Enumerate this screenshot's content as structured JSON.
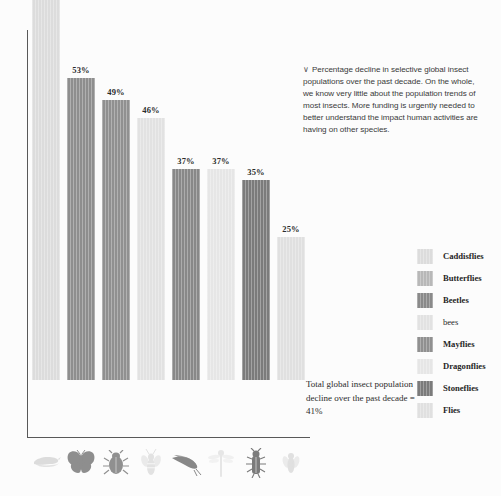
{
  "chart_data": {
    "type": "bar",
    "title": "",
    "subtitle": "",
    "xlabel": "",
    "ylabel": "",
    "ylim": [
      0,
      75
    ],
    "grid": false,
    "legend_position": "right",
    "categories": [
      "Caddisflies",
      "Butterflies",
      "Beetles",
      "bees",
      "Mayflies",
      "Dragonflies",
      "Stoneflies",
      "Flies"
    ],
    "values": [
      68,
      53,
      49,
      46,
      37,
      37,
      35,
      25
    ],
    "value_labels": [
      "68%",
      "53%",
      "49%",
      "46%",
      "37%",
      "37%",
      "35%",
      "25%"
    ],
    "colors": [
      "#dcdcdc",
      "#8e8e8e",
      "#909090",
      "#e2e2e2",
      "#888888",
      "#e6e6e6",
      "#7b7b7b",
      "#e0e0e0"
    ],
    "icons": [
      "caddisfly-icon",
      "butterfly-icon",
      "beetle-icon",
      "bee-icon",
      "mayfly-icon",
      "dragonfly-icon",
      "stonefly-icon",
      "fly-icon"
    ]
  },
  "description": {
    "chevron": "∨",
    "text": "Percentage decline in selective global insect populations over the past decade. On the whole, we know very little about the population trends of most insects. More funding is urgently needed to better understand the impact human activities are having on other species."
  },
  "total_note": {
    "text": "Total global insect population decline over the past decade = 41%"
  },
  "legend": {
    "items": [
      {
        "label": "Caddisflies",
        "color": "#dcdcdc"
      },
      {
        "label": "Butterflies",
        "color": "#b8b8b8"
      },
      {
        "label": "Beetles",
        "color": "#8a8a8a"
      },
      {
        "label": "bees",
        "color": "#e2e2e2"
      },
      {
        "label": "Mayflies",
        "color": "#909090"
      },
      {
        "label": "Dragonflies",
        "color": "#e6e6e6"
      },
      {
        "label": "Stoneflies",
        "color": "#7b7b7b"
      },
      {
        "label": "Flies",
        "color": "#e0e0e0"
      }
    ]
  },
  "axis": {
    "line_color": "#595959"
  }
}
